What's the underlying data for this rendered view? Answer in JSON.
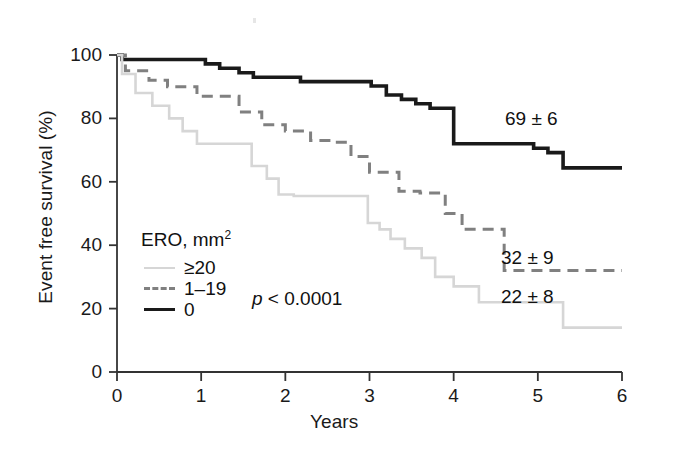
{
  "chart_data": {
    "type": "line",
    "title": "",
    "subtitle": "",
    "xlabel": "Years",
    "ylabel": "Event free survival (%)",
    "xlim": [
      0,
      6
    ],
    "ylim": [
      0,
      100
    ],
    "xticks": [
      "0",
      "1",
      "2",
      "3",
      "4",
      "5",
      "6"
    ],
    "yticks": [
      "0",
      "20",
      "40",
      "60",
      "80",
      "100"
    ],
    "grid": false,
    "legend_position": "inside-lower-left",
    "legend_title": "ERO, mm",
    "legend_title_sup": "2",
    "statistic_annotation": "p < 0.0001",
    "statistic_p_italic": "p",
    "statistic_rest": " < 0.0001",
    "series": [
      {
        "name": "0",
        "legend_label": "0",
        "style": "solid",
        "color": "#1a1a1a",
        "width": 3.6,
        "endpoint_label": "69 ± 6",
        "x": [
          0,
          0.06,
          0.06,
          1.05,
          1.05,
          1.22,
          1.22,
          1.45,
          1.45,
          1.62,
          1.62,
          2.02,
          2.02,
          2.18,
          2.18,
          3.02,
          3.02,
          3.2,
          3.2,
          3.38,
          3.38,
          3.55,
          3.55,
          3.72,
          3.72,
          4.0,
          4.0,
          4.95,
          4.95,
          5.12,
          5.12,
          5.3,
          5.3,
          6.0
        ],
        "y": [
          100,
          100,
          98.6,
          98.6,
          97.2,
          97.2,
          95.8,
          95.8,
          94.4,
          94.4,
          93.0,
          93.0,
          93.0,
          93.0,
          91.6,
          91.6,
          90.2,
          90.2,
          87.4,
          87.4,
          86.0,
          86.0,
          84.6,
          84.6,
          83.2,
          83.2,
          72.0,
          72.0,
          70.6,
          70.6,
          69.2,
          69.2,
          64.4,
          64.4
        ]
      },
      {
        "name": "1-19",
        "legend_label": "1–19",
        "style": "dashed",
        "color": "#808080",
        "width": 3.0,
        "endpoint_label": "32 ± 9",
        "x": [
          0,
          0.1,
          0.1,
          0.38,
          0.38,
          0.6,
          0.6,
          0.95,
          0.95,
          1.45,
          1.45,
          1.72,
          1.72,
          2.0,
          2.0,
          2.3,
          2.3,
          2.55,
          2.55,
          2.78,
          2.78,
          3.0,
          3.0,
          3.35,
          3.35,
          3.6,
          3.6,
          3.9,
          3.9,
          4.1,
          4.1,
          4.6,
          4.6,
          6.0
        ],
        "y": [
          100,
          100,
          95.0,
          95.0,
          92.0,
          92.0,
          90.0,
          90.0,
          87.0,
          87.0,
          82.0,
          82.0,
          78.0,
          78.0,
          76.0,
          76.0,
          73.0,
          73.0,
          72.5,
          72.5,
          68.0,
          68.0,
          63.0,
          63.0,
          57.0,
          57.0,
          56.5,
          56.5,
          50.0,
          50.0,
          45.0,
          45.0,
          32.0,
          32.0
        ]
      },
      {
        "name": "≥20",
        "legend_label": "≥20",
        "style": "solid",
        "color": "#d6d6d6",
        "width": 2.6,
        "endpoint_label": "22 ± 8",
        "x": [
          0,
          0.06,
          0.06,
          0.22,
          0.22,
          0.42,
          0.42,
          0.62,
          0.62,
          0.78,
          0.78,
          0.95,
          0.95,
          1.6,
          1.6,
          1.78,
          1.78,
          1.92,
          1.92,
          2.1,
          2.1,
          2.98,
          2.98,
          3.12,
          3.12,
          3.25,
          3.25,
          3.42,
          3.42,
          3.62,
          3.62,
          3.78,
          3.78,
          4.0,
          4.0,
          4.3,
          4.3,
          5.3,
          5.3,
          6.0
        ],
        "y": [
          100,
          100,
          94.0,
          94.0,
          88.0,
          88.0,
          84.0,
          84.0,
          80.0,
          80.0,
          76.0,
          76.0,
          72.0,
          72.0,
          65.0,
          65.0,
          61.0,
          61.0,
          56.0,
          56.0,
          55.5,
          55.5,
          47.0,
          47.0,
          45.0,
          45.0,
          42.0,
          42.0,
          39.0,
          39.0,
          36.0,
          36.0,
          30.0,
          30.0,
          27.0,
          27.0,
          22.0,
          22.0,
          14.0,
          14.0
        ]
      }
    ],
    "annotations": [
      {
        "text": "69 ± 6",
        "x_px": 505,
        "y_px": 108
      },
      {
        "text": "32 ± 9",
        "x_px": 501,
        "y_px": 247
      },
      {
        "text": "22 ± 8",
        "x_px": 501,
        "y_px": 286
      }
    ]
  },
  "axes": {
    "x": {
      "label": "Years",
      "ticks": [
        "0",
        "1",
        "2",
        "3",
        "4",
        "5",
        "6"
      ]
    },
    "y": {
      "label": "Event free survival (%)",
      "ticks": [
        "100",
        "80",
        "60",
        "40",
        "20",
        "0"
      ]
    }
  },
  "legend": {
    "title": "ERO, mm",
    "title_superscript": "2",
    "items": [
      {
        "label": "≥20",
        "color": "#d6d6d6",
        "style": "solid"
      },
      {
        "label": "1–19",
        "color": "#808080",
        "style": "dashed"
      },
      {
        "label": "0",
        "color": "#1a1a1a",
        "style": "solid"
      }
    ]
  },
  "colors": {
    "axis": "#333333",
    "text": "#1a1a1a",
    "series_black": "#1a1a1a",
    "series_gray": "#808080",
    "series_light": "#d6d6d6",
    "background": "#ffffff"
  }
}
